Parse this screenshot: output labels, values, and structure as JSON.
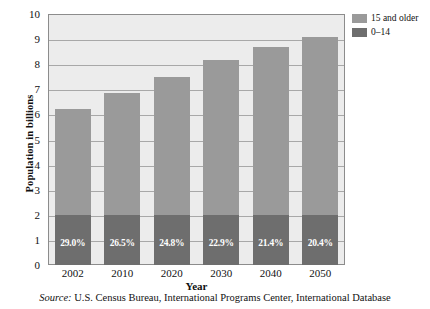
{
  "chart_data": {
    "type": "bar",
    "stacked": true,
    "title": "",
    "xlabel": "Year",
    "ylabel": "Population in billions",
    "categories": [
      "2002",
      "2010",
      "2020",
      "2030",
      "2040",
      "2050"
    ],
    "ylim": [
      0,
      10
    ],
    "ytick_labels": [
      "0",
      "1",
      "2",
      "3",
      "4",
      "5",
      "6",
      "7",
      "8",
      "9",
      "10"
    ],
    "yticks": [
      0,
      1,
      2,
      3,
      4,
      5,
      6,
      7,
      8,
      9,
      10
    ],
    "grid": true,
    "legend_position": "top-right",
    "series": [
      {
        "name": "15 and older",
        "color": "#9a9a9a",
        "values": [
          4.2,
          4.85,
          5.5,
          6.15,
          6.7,
          7.1
        ]
      },
      {
        "name": "0–14",
        "color": "#6e6e6e",
        "values": [
          2.0,
          2.0,
          2.0,
          2.0,
          2.0,
          2.0
        ],
        "data_labels": [
          "29.0%",
          "26.5%",
          "24.8%",
          "22.9%",
          "21.4%",
          "20.4%"
        ]
      }
    ],
    "totals": [
      6.2,
      6.85,
      7.5,
      8.15,
      8.7,
      9.1
    ],
    "annotations": []
  },
  "legend": {
    "items": [
      {
        "label": "15 and older",
        "color": "#9a9a9a"
      },
      {
        "label": "0–14",
        "color": "#6e6e6e"
      }
    ]
  },
  "source": {
    "prefix": "Source:",
    "text": " U.S. Census Bureau, International Programs Center, International Database"
  },
  "colors": {
    "plot_background": "#ececec",
    "gridline": "#a8a8a8",
    "frame": "#8c8c8c",
    "series_older": "#9a9a9a",
    "series_young": "#6e6e6e",
    "label_text": "#ffffff"
  }
}
